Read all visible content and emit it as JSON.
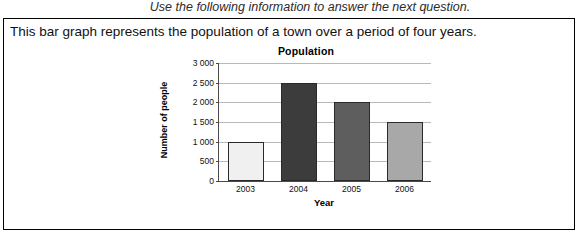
{
  "instruction": "Use the following information to answer the next question.",
  "question_text": "This bar graph represents the population of a town over a period of four years.",
  "chart_data": {
    "type": "bar",
    "title": "Population",
    "xlabel": "Year",
    "ylabel": "Number of people",
    "categories": [
      "2003",
      "2004",
      "2005",
      "2006"
    ],
    "values": [
      1000,
      2500,
      2000,
      1500
    ],
    "bar_colors": [
      "#f0f0f0",
      "#3c3c3c",
      "#5e5e5e",
      "#a8a8a8"
    ],
    "ylim": [
      0,
      3000
    ],
    "yticks": [
      0,
      500,
      1000,
      1500,
      2000,
      2500,
      3000
    ],
    "ytick_labels": [
      "0",
      "500",
      "1 000",
      "1 500",
      "2 000",
      "2 500",
      "3 000"
    ],
    "grid": true,
    "legend": false
  }
}
